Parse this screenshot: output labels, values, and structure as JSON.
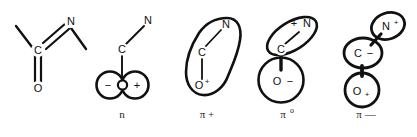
{
  "figure": {
    "background_color": "#ffffff",
    "line_color": "#111111",
    "structures": [
      {
        "id": "lewis",
        "name": "lewis-structure",
        "caption": "",
        "caption_sup": "",
        "atoms": [
          {
            "label": "C",
            "charge": ""
          },
          {
            "label": "N",
            "charge": ""
          },
          {
            "label": "O",
            "charge": ""
          }
        ],
        "bonds": [
          "C=N double bond",
          "C=O double bond",
          "two methyl single bonds"
        ]
      },
      {
        "id": "n",
        "name": "n-orbital",
        "caption": "n",
        "caption_sup": "",
        "atoms": [
          {
            "label": "C",
            "charge": ""
          },
          {
            "label": "N",
            "charge": ""
          }
        ],
        "lobes": [
          {
            "sign": "−",
            "position": "left"
          },
          {
            "sign": "+",
            "position": "right"
          }
        ]
      },
      {
        "id": "pi-plus",
        "name": "pi-plus-orbital",
        "caption": "π +",
        "caption_sup": "",
        "atoms": [
          {
            "label": "N",
            "charge": ""
          },
          {
            "label": "C",
            "charge": ""
          },
          {
            "label": "O",
            "charge": "+"
          }
        ]
      },
      {
        "id": "pi-zero",
        "name": "pi-zero-orbital",
        "caption": "π",
        "caption_sup": "o",
        "atoms": [
          {
            "label": "N",
            "charge": "+",
            "charge_position": "before"
          },
          {
            "label": "C",
            "charge": ""
          },
          {
            "label": "O",
            "charge": "−",
            "charge_position": "after"
          }
        ]
      },
      {
        "id": "pi-minus",
        "name": "pi-minus-orbital",
        "caption": "π —",
        "caption_sup": "",
        "atoms": [
          {
            "label": "N",
            "charge": "+",
            "charge_position": "sup"
          },
          {
            "label": "C",
            "charge": "−",
            "charge_position": "after"
          },
          {
            "label": "O",
            "charge": "+",
            "charge_position": "sub"
          }
        ]
      }
    ]
  }
}
